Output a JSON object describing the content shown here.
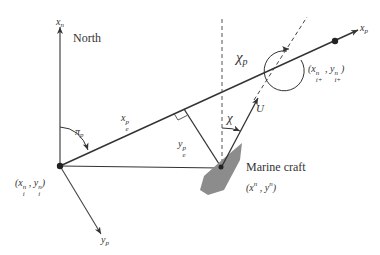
{
  "diagram": {
    "labels": {
      "north_axis": "x",
      "north_axis_sub": "n",
      "north": "North",
      "path_axis": "x",
      "path_axis_sub": "p",
      "cross_axis": "y",
      "cross_axis_sub": "p",
      "path_angle": "π",
      "path_angle_sub": "p",
      "along_track": "x",
      "along_track_sup": "p",
      "along_track_sub": "e",
      "cross_track": "y",
      "cross_track_sup": "p",
      "cross_track_sub": "e",
      "course_angle": "χ",
      "course_angle_p": "χ",
      "course_angle_p_sub": "p",
      "speed": "U",
      "vessel": "Marine craft",
      "vessel_pos": "(x",
      "vessel_pos_x_sup": "n",
      "vessel_pos_mid": " , y",
      "vessel_pos_y_sup": "n",
      "vessel_pos_end": ")",
      "wp_start_open": "(x",
      "wp_start_x_sup": "n",
      "wp_start_x_sub": "i",
      "wp_start_mid": " , y",
      "wp_start_y_sup": "n",
      "wp_start_y_sub": "i",
      "wp_start_close": ")",
      "wp_next_open": "(x",
      "wp_next_x_sup": "n",
      "wp_next_x_sub": "i+",
      "wp_next_mid": " , y",
      "wp_next_y_sup": "n",
      "wp_next_y_sub": "i+",
      "wp_next_close": ")"
    },
    "colors": {
      "line": "#333333",
      "dashed": "#444444",
      "vessel_fill": "#8c8c8c",
      "background": "#ffffff"
    }
  }
}
